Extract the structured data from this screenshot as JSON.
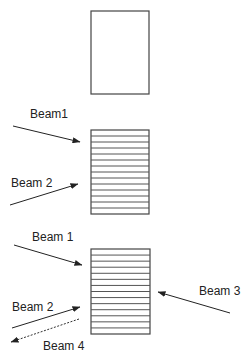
{
  "diagram": {
    "panels": [
      {
        "id": "panel-1",
        "sample": {
          "x": 91,
          "y": 11,
          "w": 58,
          "h": 83,
          "layers": 0
        },
        "beams": []
      },
      {
        "id": "panel-2",
        "sample": {
          "x": 91,
          "y": 130,
          "w": 58,
          "h": 84,
          "layers": 14
        },
        "beams": [
          {
            "label": "Beam1",
            "label_x": 30,
            "label_y": 118,
            "x1": 13,
            "y1": 126,
            "x2": 80,
            "y2": 142,
            "style": "solid"
          },
          {
            "label": "Beam 2",
            "label_x": 11,
            "label_y": 187,
            "x1": 10,
            "y1": 205,
            "x2": 78,
            "y2": 184,
            "style": "solid"
          }
        ]
      },
      {
        "id": "panel-3",
        "sample": {
          "x": 91,
          "y": 249,
          "w": 59,
          "h": 85,
          "layers": 14
        },
        "beams": [
          {
            "label": "Beam 1",
            "label_x": 32,
            "label_y": 241,
            "x1": 14,
            "y1": 245,
            "x2": 82,
            "y2": 265,
            "style": "solid"
          },
          {
            "label": "Beam 2",
            "label_x": 12,
            "label_y": 311,
            "x1": 12,
            "y1": 328,
            "x2": 80,
            "y2": 307,
            "style": "solid"
          },
          {
            "label": "Beam 3",
            "label_x": 199,
            "label_y": 295,
            "x1": 230,
            "y1": 313,
            "x2": 158,
            "y2": 292,
            "style": "solid"
          },
          {
            "label": "Beam 4",
            "label_x": 43,
            "label_y": 350,
            "x1": 79,
            "y1": 319,
            "x2": 11,
            "y2": 342,
            "style": "dashed"
          }
        ]
      }
    ]
  },
  "labels": {
    "p2_beam1": "Beam1",
    "p2_beam2": "Beam 2",
    "p3_beam1": "Beam 1",
    "p3_beam2": "Beam 2",
    "p3_beam3": "Beam 3",
    "p3_beam4": "Beam 4"
  },
  "colors": {
    "background": "#ffffff",
    "stroke": "#222222"
  }
}
